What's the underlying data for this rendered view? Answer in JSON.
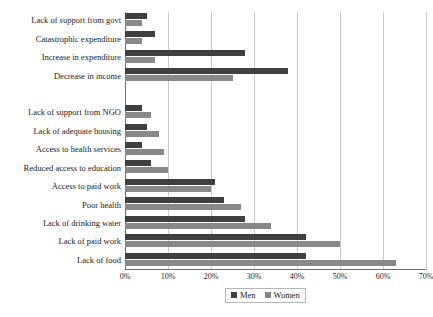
{
  "chart_data": {
    "type": "bar",
    "orientation": "horizontal",
    "title": "",
    "xlabel": "",
    "ylabel": "",
    "xlim": [
      0,
      70
    ],
    "xticks": [
      "0%",
      "10%",
      "20%",
      "30%",
      "40%",
      "50%",
      "60%",
      "70%"
    ],
    "xtick_values": [
      0,
      10,
      20,
      30,
      40,
      50,
      60,
      70
    ],
    "grid": true,
    "legend_position": "bottom",
    "legend": [
      "Men",
      "Women"
    ],
    "colors": {
      "men": "#3f3f3f",
      "women": "#888888"
    },
    "categories": [
      "Lack of support from govt",
      "Catastrophic expenditure",
      "Increase in expenditure",
      "Decrease in income",
      "",
      "Lack of support from NGO",
      "Lack of adequate housing",
      "Access to health services",
      "Reduced access to education",
      "Access to paid work",
      "Poor health",
      "Lack of drinking water",
      "Lack of paid work",
      "Lack of food"
    ],
    "series": [
      {
        "name": "Men",
        "values": [
          5,
          7,
          28,
          38,
          null,
          4,
          5,
          4,
          6,
          21,
          23,
          28,
          42,
          42
        ]
      },
      {
        "name": "Women",
        "values": [
          4,
          4,
          7,
          25,
          null,
          6,
          8,
          9,
          10,
          20,
          27,
          34,
          50,
          63
        ]
      }
    ]
  },
  "legend": {
    "men_label": "Men",
    "women_label": "Women"
  }
}
